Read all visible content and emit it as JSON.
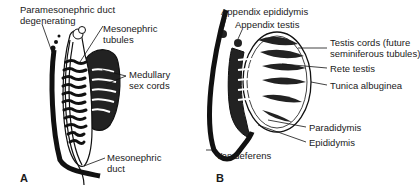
{
  "panel_a": {
    "letter": "A",
    "labels": {
      "paramesonephric_1": "Paramesonephric duct",
      "paramesonephric_2": "degenerating",
      "mesonephric_tubules_1": "Mesonephric",
      "mesonephric_tubules_2": "tubules",
      "medullary_1": "Medullary",
      "medullary_2": "sex cords",
      "mesonephric_duct_1": "Mesonephric",
      "mesonephric_duct_2": "duct"
    }
  },
  "panel_b": {
    "letter": "B",
    "labels": {
      "appendix_epididymis": "Appendix epididymis",
      "appendix_testis": "Appendix testis",
      "testis_cords_1": "Testis cords (future",
      "testis_cords_2": "seminiferous tubules)",
      "rete_testis": "Rete testis",
      "tunica_albuginea": "Tunica albuginea",
      "paradidymis": "Paradidymis",
      "epididymis": "Epididymis",
      "vas_deferens": "Vas deferens"
    }
  },
  "colors": {
    "ink": "#1a1a1a",
    "background": "#ffffff"
  }
}
